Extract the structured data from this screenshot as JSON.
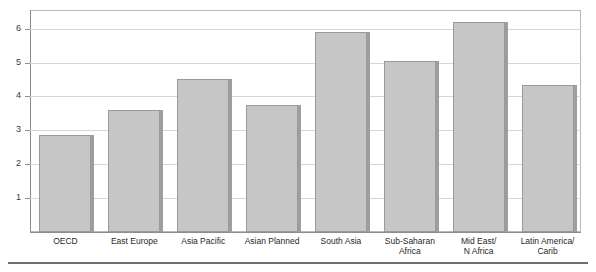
{
  "figure": {
    "title_fragment": "per capita growth",
    "bottom_rule": "rule"
  },
  "chart_data": {
    "type": "bar",
    "title": "",
    "xlabel": "",
    "ylabel": "",
    "ylim": [
      0,
      6.55
    ],
    "grid": true,
    "legend": "none",
    "categories": [
      "OECD",
      "East Europe",
      "Asia Pacific",
      "Asian Planned",
      "South Asia",
      "Sub-Saharan\nAfrica",
      "Mid East/\nN Africa",
      "Latin America/\nCarib"
    ],
    "values": [
      2.85,
      3.6,
      4.5,
      3.75,
      5.9,
      5.05,
      6.2,
      4.35
    ],
    "yticks": [
      1,
      2,
      3,
      4,
      5,
      6
    ],
    "ytick_labels": [
      "1",
      "2",
      "3",
      "4",
      "5",
      "6"
    ],
    "bar_color": "#c6c6c6",
    "bar_edge_color": "#9a9a9a",
    "grid_color": "#d6d6d6",
    "axis_color": "#8d8d8d"
  }
}
